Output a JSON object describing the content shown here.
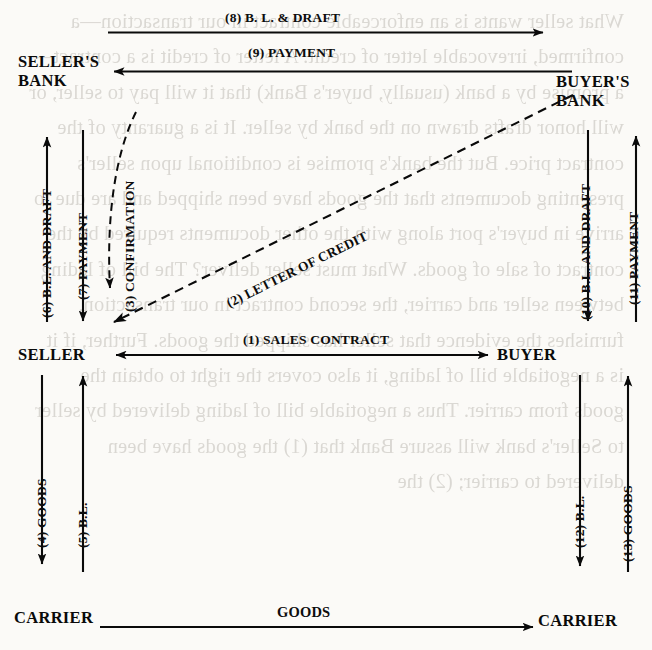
{
  "diagram": {
    "type": "flow-diagram",
    "ink_color": "#0a0a0a",
    "paper_color": "#fbfaf7",
    "nodes": [
      {
        "id": "sellers-bank",
        "label": "SELLER'S\nBANK"
      },
      {
        "id": "buyers-bank",
        "label": "BUYER'S\nBANK"
      },
      {
        "id": "seller",
        "label": "SELLER"
      },
      {
        "id": "buyer",
        "label": "BUYER"
      },
      {
        "id": "carrier-left",
        "label": "CARRIER"
      },
      {
        "id": "carrier-right",
        "label": "CARRIER"
      }
    ],
    "edges": [
      {
        "step": "1",
        "label": "(1) SALES CONTRACT",
        "from": "buyer",
        "to": "seller",
        "style": "solid",
        "orientation": "horizontal"
      },
      {
        "step": "2",
        "label": "(2) LETTER OF CREDIT",
        "from": "buyers-bank",
        "to": "seller",
        "style": "dashed",
        "orientation": "diagonal"
      },
      {
        "step": "3",
        "label": "(3) CONFIRMATION",
        "from": "sellers-bank",
        "to": "seller",
        "style": "dashed",
        "orientation": "vertical"
      },
      {
        "step": "4",
        "label": "(4) GOODS",
        "from": "seller",
        "to": "carrier-left",
        "style": "solid",
        "orientation": "vertical"
      },
      {
        "step": "5",
        "label": "(5) B.L.",
        "from": "carrier-left",
        "to": "seller",
        "style": "solid",
        "orientation": "vertical"
      },
      {
        "step": "6",
        "label": "(6) B.L. AND DRAFT",
        "from": "seller",
        "to": "sellers-bank",
        "style": "solid",
        "orientation": "vertical"
      },
      {
        "step": "7",
        "label": "(7) PAYMENT",
        "from": "sellers-bank",
        "to": "seller",
        "style": "solid",
        "orientation": "vertical"
      },
      {
        "step": "8",
        "label": "(8) B. L. & DRAFT",
        "from": "sellers-bank",
        "to": "buyers-bank",
        "style": "solid",
        "orientation": "horizontal"
      },
      {
        "step": "9",
        "label": "(9) PAYMENT",
        "from": "buyers-bank",
        "to": "sellers-bank",
        "style": "solid",
        "orientation": "horizontal"
      },
      {
        "step": "10",
        "label": "(10) B.L. AND DRAFT",
        "from": "buyers-bank",
        "to": "buyer",
        "style": "solid",
        "orientation": "vertical"
      },
      {
        "step": "11",
        "label": "(11) PAYMENT",
        "from": "buyer",
        "to": "buyers-bank",
        "style": "solid",
        "orientation": "vertical"
      },
      {
        "step": "12",
        "label": "(12) B.L.",
        "from": "buyer",
        "to": "carrier-right",
        "style": "solid",
        "orientation": "vertical"
      },
      {
        "step": "13",
        "label": "(13) GOODS",
        "from": "carrier-right",
        "to": "buyer",
        "style": "solid",
        "orientation": "vertical"
      },
      {
        "step": "",
        "label": "GOODS",
        "from": "carrier-left",
        "to": "carrier-right",
        "style": "solid",
        "orientation": "horizontal"
      }
    ]
  },
  "background_text": "What seller wants is an enforceable contract in our transaction—a confirmed, irrevocable letter of credit. A letter of credit is a contract—a promise by a bank (usually, buyer's Bank) that it will pay to seller, or will honor drafts drawn on the bank by seller. It is a guaranty of the contract price. But the bank's promise is conditional upon seller's presenting documents that the goods have been shipped and are due to arrive in buyer's port along with the other documents required by the contract of sale of goods. What must seller deliver? The bill of lading between seller and carrier, the second contract in our transaction, furnishes the evidence that seller has shipped the goods. Further, if it is a negotiable bill of lading, it also covers the right to obtain the goods from carrier. Thus a negotiable bill of lading delivered by seller to Seller's bank will assure Bank that (1) the goods have been delivered to carrier; (2) the"
}
